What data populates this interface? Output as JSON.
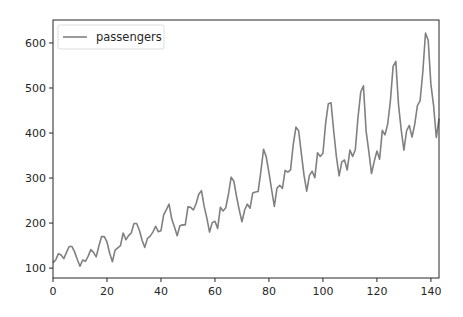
{
  "chart_data": {
    "type": "line",
    "title": "",
    "xlabel": "",
    "ylabel": "",
    "xlim": [
      0,
      143
    ],
    "ylim": [
      78,
      651
    ],
    "xticks": [
      0,
      20,
      40,
      60,
      80,
      100,
      120,
      140
    ],
    "yticks": [
      100,
      200,
      300,
      400,
      500,
      600
    ],
    "grid": false,
    "legend_position": "upper left",
    "series": [
      {
        "name": "passengers",
        "color": "#808080",
        "x_start": 0,
        "values": [
          112,
          118,
          132,
          129,
          121,
          135,
          148,
          148,
          136,
          119,
          104,
          118,
          115,
          126,
          141,
          135,
          125,
          149,
          170,
          170,
          158,
          133,
          114,
          140,
          145,
          150,
          178,
          163,
          172,
          178,
          199,
          199,
          184,
          162,
          146,
          166,
          171,
          180,
          193,
          181,
          183,
          218,
          230,
          242,
          209,
          191,
          172,
          194,
          196,
          196,
          236,
          235,
          229,
          243,
          264,
          272,
          237,
          211,
          180,
          201,
          204,
          188,
          235,
          227,
          234,
          264,
          302,
          293,
          259,
          229,
          203,
          229,
          242,
          233,
          267,
          269,
          270,
          315,
          364,
          347,
          312,
          274,
          237,
          278,
          284,
          277,
          317,
          313,
          318,
          374,
          413,
          405,
          355,
          306,
          271,
          306,
          315,
          301,
          356,
          348,
          355,
          422,
          465,
          467,
          404,
          347,
          305,
          336,
          340,
          318,
          362,
          348,
          363,
          435,
          491,
          505,
          404,
          359,
          310,
          337,
          360,
          342,
          406,
          396,
          420,
          472,
          548,
          559,
          463,
          407,
          362,
          405,
          417,
          391,
          419,
          461,
          472,
          535,
          622,
          606,
          508,
          461,
          390,
          432
        ]
      }
    ]
  },
  "legend": {
    "label": "passengers"
  }
}
